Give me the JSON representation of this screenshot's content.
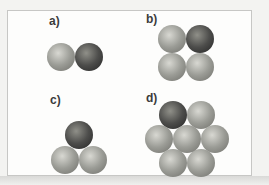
{
  "figure": {
    "sphere_radius": 14,
    "colors": {
      "light": {
        "highlight": "#d8d8d2",
        "body": "#9b9c96",
        "edge": "#6e6e69"
      },
      "dark": {
        "highlight": "#909089",
        "body": "#4d4d4b",
        "edge": "#242424"
      },
      "label_text": "#3b3b3b",
      "frame_border": "#c7c7c5",
      "frame_background": "#fdfdfc",
      "outer_background": "#f3f3f1"
    },
    "panels": [
      {
        "id": "a",
        "label": "a)",
        "label_x": 49,
        "label_y": 15,
        "arrangement": "dimer",
        "spheres": [
          {
            "cx": 61,
            "cy": 57,
            "shade": "light"
          },
          {
            "cx": 89,
            "cy": 57,
            "shade": "dark"
          }
        ]
      },
      {
        "id": "b",
        "label": "b)",
        "label_x": 146,
        "label_y": 13,
        "arrangement": "square-tetramer",
        "spheres": [
          {
            "cx": 172,
            "cy": 38.5,
            "shade": "light"
          },
          {
            "cx": 200,
            "cy": 38.5,
            "shade": "dark"
          },
          {
            "cx": 172,
            "cy": 66.5,
            "shade": "light"
          },
          {
            "cx": 200,
            "cy": 66.5,
            "shade": "light"
          }
        ]
      },
      {
        "id": "c",
        "label": "c)",
        "label_x": 50,
        "label_y": 94,
        "arrangement": "triangle-trimer",
        "spheres": [
          {
            "cx": 79,
            "cy": 135.3,
            "shade": "dark"
          },
          {
            "cx": 65,
            "cy": 159.5,
            "shade": "light"
          },
          {
            "cx": 93,
            "cy": 159.5,
            "shade": "light"
          }
        ]
      },
      {
        "id": "d",
        "label": "d)",
        "label_x": 146,
        "label_y": 92,
        "arrangement": "hexagonal-heptamer",
        "spheres": [
          {
            "cx": 173,
            "cy": 115,
            "shade": "dark"
          },
          {
            "cx": 201,
            "cy": 115,
            "shade": "light"
          },
          {
            "cx": 159,
            "cy": 139,
            "shade": "light"
          },
          {
            "cx": 215,
            "cy": 139,
            "shade": "light"
          },
          {
            "cx": 173,
            "cy": 163,
            "shade": "light"
          },
          {
            "cx": 201,
            "cy": 163,
            "shade": "light"
          },
          {
            "cx": 187,
            "cy": 139,
            "shade": "light"
          }
        ]
      }
    ]
  }
}
